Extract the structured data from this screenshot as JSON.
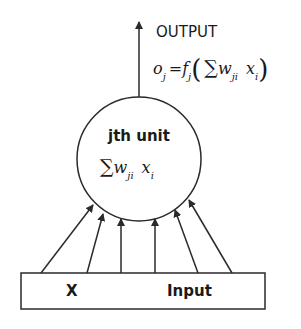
{
  "diagram": {
    "output": {
      "label": "OUTPUT",
      "formula": {
        "lhs": "o",
        "lhs_sub": "j",
        "equals": "=",
        "func": "f",
        "func_sub": "j",
        "open_paren": "(",
        "sigma": "∑",
        "weight": "w",
        "weight_sub": "ji",
        "input": "x",
        "input_sub": "i",
        "close_paren": ")"
      }
    },
    "unit": {
      "label": "jth unit",
      "formula": {
        "sigma": "∑",
        "weight": "w",
        "weight_sub": "ji",
        "input": "x",
        "input_sub": "i"
      }
    },
    "input_box": {
      "left_label": "X",
      "right_label": "Input"
    },
    "input_arrow_count": 6,
    "colors": {
      "stroke": "#2a2a2a",
      "background": "#ffffff",
      "text": "#1a1a1a"
    }
  }
}
